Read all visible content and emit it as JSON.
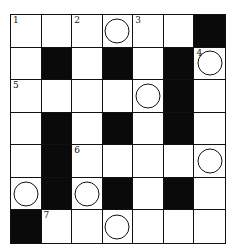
{
  "puzzle": {
    "rows": 7,
    "cols": 7,
    "cells": [
      [
        {
          "n": "1"
        },
        {},
        {
          "n": "2"
        },
        {
          "c": true
        },
        {
          "n": "3"
        },
        {},
        {
          "b": true
        }
      ],
      [
        {},
        {
          "b": true
        },
        {},
        {
          "b": true
        },
        {},
        {
          "b": true
        },
        {
          "n": "4",
          "c": true
        }
      ],
      [
        {
          "n": "5"
        },
        {},
        {},
        {},
        {
          "c": true
        },
        {
          "b": true
        },
        {}
      ],
      [
        {},
        {
          "b": true
        },
        {},
        {
          "b": true
        },
        {},
        {
          "b": true
        },
        {}
      ],
      [
        {},
        {
          "b": true
        },
        {
          "n": "6"
        },
        {},
        {},
        {},
        {
          "c": true
        }
      ],
      [
        {
          "c": true
        },
        {
          "b": true
        },
        {
          "c": true
        },
        {
          "b": true
        },
        {},
        {
          "b": true
        },
        {}
      ],
      [
        {
          "b": true
        },
        {
          "n": "7"
        },
        {},
        {
          "c": true
        },
        {},
        {},
        {}
      ]
    ]
  }
}
